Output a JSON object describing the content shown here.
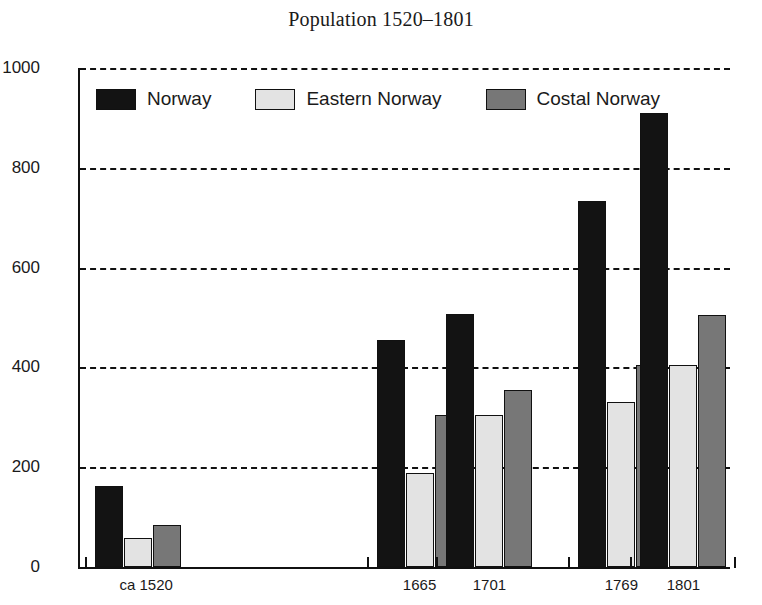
{
  "chart_data": {
    "type": "bar",
    "title": "Population 1520–1801",
    "xlabel": "",
    "ylabel": "",
    "ylim": [
      0,
      1000
    ],
    "yticks": [
      0,
      200,
      400,
      600,
      800,
      1000
    ],
    "grid": true,
    "grid_axis": "y",
    "legend_position": "top-left-inside",
    "categories": [
      "ca 1520",
      "1665",
      "1701",
      "1769",
      "1801"
    ],
    "category_positions": [
      1520,
      1665,
      1701,
      1769,
      1801
    ],
    "xaxis_scale": "time",
    "xlim": [
      1490,
      1825
    ],
    "series": [
      {
        "name": "Norway",
        "color": "#131313",
        "values": [
          162,
          455,
          508,
          733,
          910
        ]
      },
      {
        "name": "Eastern Norway",
        "color": "#e3e3e3",
        "values": [
          58,
          188,
          305,
          330,
          405
        ]
      },
      {
        "name": "Costal Norway",
        "color": "#777777",
        "values": [
          85,
          305,
          355,
          405,
          505
        ]
      }
    ]
  }
}
